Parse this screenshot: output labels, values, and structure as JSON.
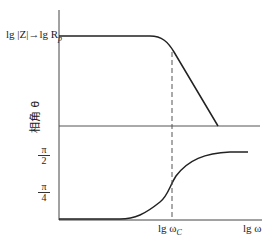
{
  "diagram": {
    "mag_label": "lg |Z|→lg R",
    "mag_label_sub": "p",
    "phase_label": "相角 θ",
    "tick_pi2_num": "π",
    "tick_pi2_den": "2",
    "tick_pi4_num": "π",
    "tick_pi4_den": "4",
    "x_tick_wc": "lg ω",
    "x_tick_wc_sub": "C",
    "x_axis_label": "lg ω"
  }
}
